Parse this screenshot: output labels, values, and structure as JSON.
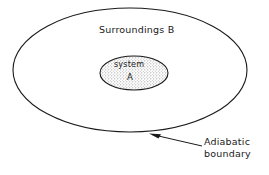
{
  "figure": {
    "background_color": "#ffffff",
    "line_color": "#1a1a1a",
    "fill_color": "#d9d9d9"
  },
  "outer_region": {
    "label": "Surroundings B",
    "shape": "ellipse",
    "cx": 130,
    "cy": 70,
    "rx": 117,
    "ry": 62
  },
  "inner_region": {
    "label_line1": "system",
    "label_line2": "A",
    "shape": "ellipse",
    "cx": 134,
    "cy": 73,
    "rx": 34,
    "ry": 17,
    "fill": "stipple"
  },
  "annotation": {
    "line1": "Adiabatic",
    "line2": "boundary",
    "arrow_tip_x": 150,
    "arrow_tip_y": 134,
    "arrow_tail_x": 202,
    "arrow_tail_y": 146
  }
}
